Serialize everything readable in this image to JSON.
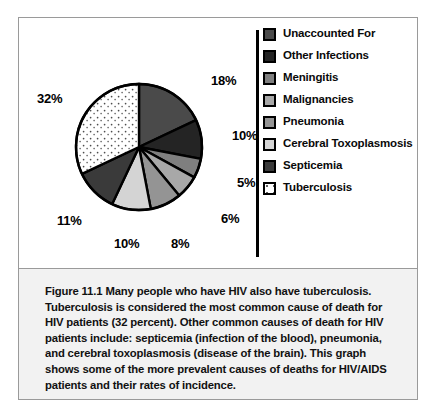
{
  "figure": {
    "number_label": "Figure 11.1",
    "caption": "Many people who have HIV also have tuberculosis. Tuberculosis is considered the most common cause of death for HIV patients (32 percent). Other common causes of death for HIV patients include: septicemia (infection of the blood), pneumonia, and cerebral toxoplasmosis (disease of the brain). This graph shows some of the more prevalent causes of deaths for HIV/AIDS patients and their rates of incidence."
  },
  "legend": {
    "items": [
      {
        "label": "Unaccounted For",
        "color": "#4a4a4a",
        "pattern": "solid"
      },
      {
        "label": "Other Infections",
        "color": "#242424",
        "pattern": "solid"
      },
      {
        "label": "Meningitis",
        "color": "#7f7f7f",
        "pattern": "solid"
      },
      {
        "label": "Malignancies",
        "color": "#a8a8a8",
        "pattern": "solid"
      },
      {
        "label": "Pneumonia",
        "color": "#949494",
        "pattern": "solid"
      },
      {
        "label": "Cerebral Toxoplasmosis",
        "color": "#d4d4d4",
        "pattern": "solid"
      },
      {
        "label": "Septicemia",
        "color": "#3a3a3a",
        "pattern": "solid"
      },
      {
        "label": "Tuberculosis",
        "color": "#ffffff",
        "pattern": "dotted"
      }
    ]
  },
  "chart_data": {
    "type": "pie",
    "title": "",
    "start_angle_deg": 0,
    "direction": "clockwise",
    "legend_position": "right",
    "categories": [
      "Unaccounted For",
      "Other Infections",
      "Meningitis",
      "Malignancies",
      "Pneumonia",
      "Cerebral Toxoplasmosis",
      "Septicemia",
      "Tuberculosis"
    ],
    "values": [
      18,
      10,
      5,
      6,
      8,
      10,
      11,
      32
    ],
    "value_labels": [
      "18%",
      "10%",
      "5%",
      "6%",
      "8%",
      "10%",
      "11%",
      "32%"
    ],
    "colors": [
      "#4a4a4a",
      "#242424",
      "#7f7f7f",
      "#a8a8a8",
      "#949494",
      "#d4d4d4",
      "#3a3a3a",
      "#ffffff"
    ],
    "patterns": [
      "solid",
      "solid",
      "solid",
      "solid",
      "solid",
      "solid",
      "solid",
      "dotted"
    ],
    "units": "percent",
    "total": 100,
    "label_positions": [
      {
        "label": "18%",
        "x": 192,
        "y": 55
      },
      {
        "label": "10%",
        "x": 213,
        "y": 110
      },
      {
        "label": "5%",
        "x": 218,
        "y": 157
      },
      {
        "label": "6%",
        "x": 202,
        "y": 193
      },
      {
        "label": "8%",
        "x": 152,
        "y": 218
      },
      {
        "label": "10%",
        "x": 95,
        "y": 218
      },
      {
        "label": "11%",
        "x": 38,
        "y": 195
      },
      {
        "label": "32%",
        "x": 18,
        "y": 73
      }
    ]
  },
  "pie_geometry": {
    "cx": 120,
    "cy": 129,
    "r": 63,
    "stroke": "#000000",
    "stroke_width": 2.4
  }
}
